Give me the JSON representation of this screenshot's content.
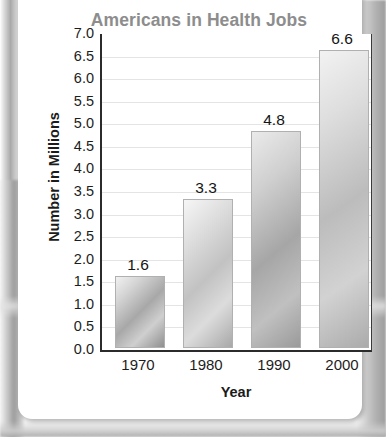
{
  "chart_data": {
    "type": "bar",
    "title": "Americans in Health Jobs",
    "xlabel": "Year",
    "ylabel": "Number in Millions",
    "categories": [
      "1970",
      "1980",
      "1990",
      "2000"
    ],
    "values": [
      1.6,
      3.3,
      4.8,
      6.6
    ],
    "value_labels": [
      "1.6",
      "3.3",
      "4.8",
      "6.6"
    ],
    "ylim": [
      0.0,
      7.0
    ],
    "ytick_step": 0.5,
    "ytick_labels": [
      "7.0",
      "6.5",
      "6.0",
      "5.5",
      "5.0",
      "4.5",
      "4.0",
      "3.5",
      "3.0",
      "2.5",
      "2.0",
      "1.5",
      "1.0",
      "0.5",
      "0.0"
    ],
    "grid": true,
    "legend": null,
    "colors": {
      "title": "#8d8d8d",
      "axis_text": "#1d1d1d",
      "axis_line": "#2b2b2b",
      "gridline": "#e4e4e4",
      "bar_light": "#f1f1f1",
      "bar_dark": "#8f8f8f",
      "card_background": "#ffffff"
    }
  }
}
